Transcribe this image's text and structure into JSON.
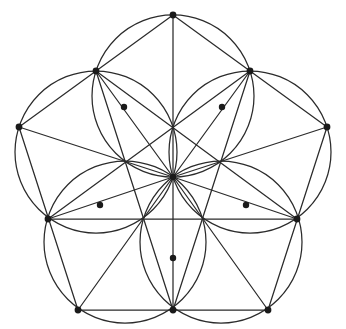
{
  "figure": {
    "title": "Pentagon Rosette Construction",
    "kind": "geometric-line-drawing",
    "background_color": "#ffffff",
    "stroke_color": "#2b2b2b",
    "dot_color": "#1a1a1a",
    "stroke_width": 1.25,
    "canvas": {
      "width": 346,
      "height": 329
    }
  },
  "geometry": {
    "center": {
      "x": 173,
      "y": 177
    },
    "pentagon": {
      "label": "outer regular pentagon",
      "circumradius": 163,
      "rotation_deg": -90,
      "vertex_count": 5,
      "vertices": [
        {
          "name": "top",
          "x": 173,
          "y": 15
        },
        {
          "name": "right",
          "x": 327,
          "y": 127
        },
        {
          "name": "bottom-right",
          "x": 268,
          "y": 310
        },
        {
          "name": "bottom-left",
          "x": 78,
          "y": 310
        },
        {
          "name": "left",
          "x": 19,
          "y": 127
        }
      ]
    },
    "incircle": {
      "label": "inscribed circle through pentagon edge midpoints",
      "radius": 132,
      "visible": false
    },
    "edge_midpoints": [
      {
        "name": "mid-top-right",
        "x": 250,
        "y": 71
      },
      {
        "name": "mid-right-bottom",
        "x": 297,
        "y": 219
      },
      {
        "name": "mid-bottom",
        "x": 173,
        "y": 310
      },
      {
        "name": "mid-bottom-left",
        "x": 48,
        "y": 219
      },
      {
        "name": "mid-left-top",
        "x": 96,
        "y": 71
      }
    ],
    "inner_points": [
      {
        "name": "inner-upper-left",
        "x": 124,
        "y": 107
      },
      {
        "name": "inner-upper-right",
        "x": 222,
        "y": 107
      },
      {
        "name": "inner-lower-right",
        "x": 246,
        "y": 205
      },
      {
        "name": "inner-bottom",
        "x": 173,
        "y": 258
      },
      {
        "name": "inner-lower-left",
        "x": 100,
        "y": 205
      }
    ],
    "rosette": {
      "label": "five overlapping circles forming rosette",
      "petal_count": 5,
      "petal_circle_radius": 81,
      "petal_center_distance": 81,
      "petal_centers": [
        {
          "x": 173,
          "y": 96
        },
        {
          "x": 250,
          "y": 152
        },
        {
          "x": 221,
          "y": 242
        },
        {
          "x": 125,
          "y": 242
        },
        {
          "x": 96,
          "y": 152
        }
      ]
    },
    "radial_lines": {
      "label": "ten radii from center",
      "count": 10,
      "targets": [
        "5 pentagon vertices",
        "5 pentagon edge midpoints"
      ]
    },
    "marked_point_count": 16
  }
}
